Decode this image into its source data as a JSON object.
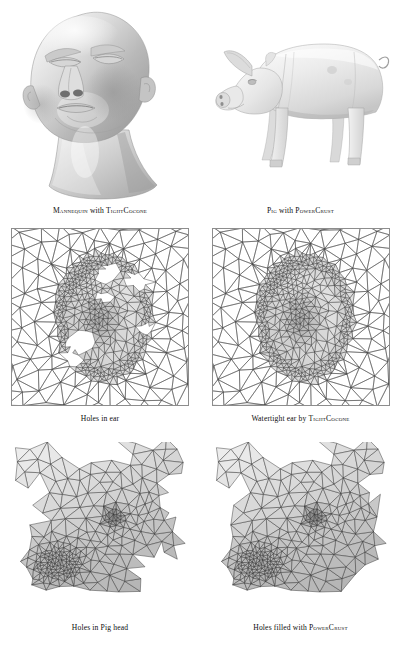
{
  "figure": {
    "kind": "surface-reconstruction-results-figure",
    "background_color": "#ffffff",
    "ink_color": "#111111"
  },
  "panels": [
    {
      "id": "mannequin",
      "row": 1,
      "column": "left",
      "subject": "mannequin head",
      "render_style": "smooth shaded grayscale surface",
      "caption_plain": "MANNEQUIN with TIGHTCocone",
      "caption_parts": {
        "model": "Mannequin",
        "connector": "with",
        "method": "TightCocone"
      }
    },
    {
      "id": "pig",
      "row": 1,
      "column": "right",
      "subject": "pig",
      "render_style": "smooth shaded grayscale surface",
      "caption_plain": "PIG with POWERCRUST",
      "caption_parts": {
        "model": "Pig",
        "connector": "with",
        "method": "PowerCrust"
      }
    },
    {
      "id": "ear-holes",
      "row": 2,
      "column": "left",
      "subject": "ear triangulated mesh with holes",
      "render_style": "triangulated wireframe",
      "caption_plain": "Holes in ear",
      "caption_parts": {
        "model": "Holes in ear",
        "connector": "",
        "method": ""
      }
    },
    {
      "id": "ear-watertight",
      "row": 2,
      "column": "right",
      "subject": "watertight ear triangulated mesh",
      "render_style": "triangulated wireframe",
      "caption_plain": "Watertight ear by TIGHTCOCONE",
      "caption_parts": {
        "model": "Watertight ear",
        "connector": "by",
        "method": "TightCocone"
      }
    },
    {
      "id": "pighead-holes",
      "row": 3,
      "column": "left",
      "subject": "pig head triangulated mesh with holes",
      "render_style": "triangulated wireframe",
      "caption_plain": "Holes in Pig head",
      "caption_parts": {
        "model": "Holes in Pig head",
        "connector": "",
        "method": ""
      }
    },
    {
      "id": "pighead-filled",
      "row": 3,
      "column": "right",
      "subject": "pig head triangulated mesh with holes filled",
      "render_style": "triangulated wireframe",
      "caption_plain": "Holes filled with POWERCRUST",
      "caption_parts": {
        "model": "Holes filled",
        "connector": "with",
        "method": "PowerCrust"
      }
    }
  ],
  "captions": {
    "mannequin": {
      "model": "Mannequin",
      "connector": " with ",
      "method": "TightCocone"
    },
    "pig": {
      "model": "Pig",
      "connector": " with ",
      "method": "PowerCrust"
    },
    "ear_holes": {
      "text": "Holes in ear"
    },
    "ear_watertight": {
      "prefix": "Watertight ear by ",
      "method": "TightCocone"
    },
    "pighead_holes": {
      "text": "Holes in Pig head"
    },
    "pighead_filled": {
      "prefix": "Holes filled with ",
      "method": "PowerCrust"
    }
  }
}
